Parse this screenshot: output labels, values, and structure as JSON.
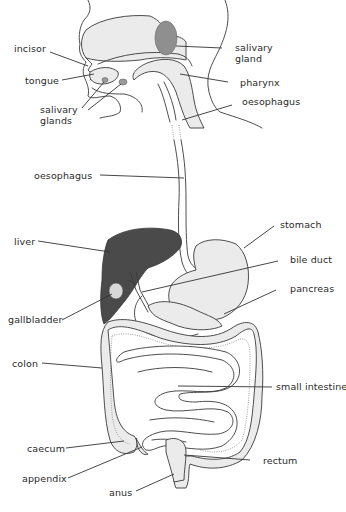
{
  "diagram": {
    "colors": {
      "liver": "#4a4a4a",
      "salivary_gland": "#8f8f8f",
      "tissue_fill": "#ebebeb",
      "outline": "#3a3a3a",
      "label_text": "#2a2a2a"
    },
    "labels": {
      "incisor": "incisor",
      "tongue": "tongue",
      "salivary_glands": "salivary\nglands",
      "salivary_gland": "salivary\ngland",
      "pharynx": "pharynx",
      "oesophagus_upper": "oesophagus",
      "oesophagus_middle": "oesophagus",
      "stomach": "stomach",
      "liver": "liver",
      "bile_duct": "bile duct",
      "pancreas": "pancreas",
      "gallbladder": "gallbladder",
      "colon": "colon",
      "small_intestine": "small intestine",
      "caecum": "caecum",
      "appendix": "appendix",
      "rectum": "rectum",
      "anus": "anus"
    }
  }
}
